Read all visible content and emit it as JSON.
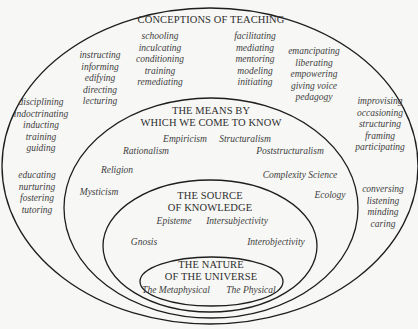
{
  "diagram": {
    "type": "nested-ellipses",
    "colors": {
      "background": "#f7f7f5",
      "stroke": "#1e1e1e",
      "text": "#3a3a3a"
    },
    "ellipses": [
      {
        "id": "conceptions",
        "title": "CONCEPTIONS OF TEACHING"
      },
      {
        "id": "means",
        "title_line1": "THE MEANS BY",
        "title_line2": "WHICH WE COME TO KNOW"
      },
      {
        "id": "source",
        "title_line1": "THE SOURCE",
        "title_line2": "OF KNOWLEDGE"
      },
      {
        "id": "nature",
        "title_line1": "THE NATURE",
        "title_line2": "OF THE UNIVERSE"
      }
    ]
  },
  "teaching_groups": [
    {
      "terms": [
        "disciplining",
        "indoctrinating",
        "inducting",
        "training",
        "guiding"
      ]
    },
    {
      "terms": [
        "instructing",
        "informing",
        "edifying",
        "directing",
        "lecturing"
      ]
    },
    {
      "terms": [
        "schooling",
        "inculcating",
        "conditioning",
        "training",
        "remediating"
      ]
    },
    {
      "terms": [
        "facilitating",
        "mediating",
        "mentoring",
        "modeling",
        "initiating"
      ]
    },
    {
      "terms": [
        "emancipating",
        "liberating",
        "empowering",
        "giving voice",
        "pedagogy"
      ]
    },
    {
      "terms": [
        "improvising",
        "occasioning",
        "structuring",
        "framing",
        "participating"
      ]
    },
    {
      "terms": [
        "educating",
        "nurturing",
        "fostering",
        "tutoring"
      ]
    },
    {
      "terms": [
        "conversing",
        "listening",
        "minding",
        "caring"
      ]
    }
  ],
  "means": {
    "empiricism": "Empiricism",
    "structuralism": "Structuralism",
    "rationalism": "Rationalism",
    "poststructuralism": "Poststructuralism",
    "religion": "Religion",
    "complexity_science": "Complexity Science",
    "mysticism": "Mysticism",
    "ecology": "Ecology"
  },
  "source": {
    "episteme": "Episteme",
    "intersubjectivity": "Intersubjectivity",
    "gnosis": "Gnosis",
    "interobjectivity": "Interobjectivity"
  },
  "nature": {
    "metaphysical": "The Metaphysical",
    "physical": "The Physical"
  }
}
